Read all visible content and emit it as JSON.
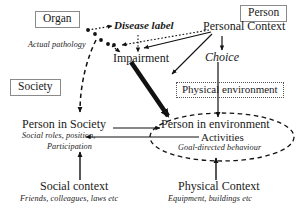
{
  "diagram": {
    "domains": {
      "organ": "Organ",
      "person": "Person",
      "society": "Society",
      "physical_environment": "Physical environment"
    },
    "nodes": {
      "disease_label": "Disease label",
      "actual_pathology": "Actual pathology",
      "impairment": "Impairment",
      "personal_context": "Personal Context",
      "choice": "Choice",
      "person_in_society": "Person in Society",
      "person_in_society_sub1": "Social roles, position,",
      "person_in_society_sub2": "Participation",
      "person_in_environment": "Person in environment",
      "person_in_environment_sub1": "Activities",
      "person_in_environment_sub2": "Goal-directed behaviour",
      "social_context": "Social context",
      "social_context_sub": "Friends, colleagues, laws etc",
      "physical_context": "Physical Context",
      "physical_context_sub": "Equipment, buildings etc"
    },
    "style": {
      "line": "#111111",
      "box_border": "#8a8a8a",
      "dotted_border": "#555555",
      "background": "#ffffff"
    }
  }
}
